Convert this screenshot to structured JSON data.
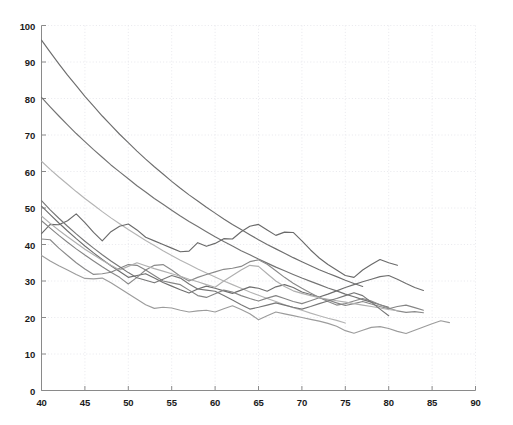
{
  "chart_data": {
    "type": "line",
    "title": "",
    "xlabel": "",
    "ylabel": "",
    "xlim": [
      40,
      90
    ],
    "ylim": [
      0,
      100
    ],
    "xticks": [
      40,
      45,
      50,
      55,
      60,
      65,
      70,
      75,
      80,
      85,
      90
    ],
    "yticks": [
      0,
      10,
      20,
      30,
      40,
      50,
      60,
      70,
      80,
      90,
      100
    ],
    "grid": true,
    "grid_style": "dotted",
    "grid_color": "#e2e2e8",
    "legend": "none",
    "background": "#ffffff",
    "axis_color": "#8a8a8a",
    "series": [
      {
        "name": "decay-1",
        "color": "#6e6e6e",
        "style": "smooth",
        "x": [
          40,
          41,
          42,
          43,
          44,
          45,
          46,
          47,
          48,
          49,
          50,
          51,
          52,
          53,
          54,
          55,
          56,
          57,
          58,
          59,
          60,
          61,
          62,
          63,
          64,
          65,
          66,
          67,
          68,
          69,
          70,
          71,
          72,
          73,
          74,
          75,
          76,
          77
        ],
        "y": [
          96.0,
          92.7,
          89.5,
          86.4,
          83.5,
          80.6,
          77.9,
          75.2,
          72.7,
          70.2,
          67.9,
          65.6,
          63.4,
          61.3,
          59.3,
          57.3,
          55.4,
          53.6,
          51.9,
          50.2,
          48.6,
          47.0,
          45.5,
          44.1,
          42.7,
          41.3,
          40.0,
          38.8,
          37.6,
          36.4,
          35.3,
          34.2,
          33.1,
          32.1,
          31.2,
          30.2,
          29.3,
          28.5
        ]
      },
      {
        "name": "decay-2",
        "color": "#737373",
        "style": "smooth",
        "x": [
          40,
          41,
          42,
          43,
          44,
          45,
          46,
          47,
          48,
          49,
          50,
          51,
          52,
          53,
          54,
          55,
          56,
          57,
          58,
          59,
          60,
          61,
          62,
          63,
          64,
          65,
          66,
          67,
          68,
          69,
          70,
          71,
          72,
          73,
          74,
          75,
          76,
          77,
          78,
          79,
          80
        ],
        "y": [
          80.3,
          77.7,
          75.2,
          72.8,
          70.4,
          68.2,
          66.0,
          63.9,
          61.8,
          59.9,
          58.0,
          56.1,
          54.4,
          52.6,
          51.0,
          49.4,
          47.8,
          46.3,
          44.9,
          43.5,
          42.1,
          40.8,
          39.6,
          38.3,
          37.2,
          36.0,
          34.9,
          33.8,
          32.8,
          31.8,
          30.8,
          29.9,
          29.0,
          28.1,
          27.3,
          26.4,
          25.7,
          24.9,
          24.2,
          23.5,
          22.8
        ]
      },
      {
        "name": "decay-3",
        "color": "#b4b4b4",
        "style": "smooth",
        "x": [
          40,
          41,
          42,
          43,
          44,
          45,
          46,
          47,
          48,
          49,
          50,
          51,
          52,
          53,
          54,
          55,
          56,
          57,
          58,
          59,
          60,
          61,
          62,
          63,
          64,
          65,
          66,
          67,
          68,
          69,
          70,
          71,
          72,
          73,
          74,
          75
        ],
        "y": [
          62.8,
          60.6,
          58.5,
          56.5,
          54.5,
          52.6,
          50.8,
          49.0,
          47.3,
          45.7,
          44.1,
          42.6,
          41.1,
          39.7,
          38.3,
          37.0,
          35.7,
          34.5,
          33.3,
          32.2,
          31.1,
          30.0,
          29.0,
          28.0,
          27.0,
          26.1,
          25.2,
          24.4,
          23.5,
          22.7,
          22.0,
          21.2,
          20.5,
          19.8,
          19.2,
          18.5
        ]
      },
      {
        "name": "noisy-1",
        "color": "#6a6a6a",
        "style": "zigzag",
        "x": [
          40,
          41,
          42,
          43,
          44,
          45,
          46,
          47,
          48,
          49,
          50,
          51,
          52,
          53,
          54,
          55,
          56,
          57,
          58,
          59,
          60,
          61,
          62,
          63,
          64,
          65,
          66,
          67,
          68,
          69,
          70,
          71,
          72,
          73,
          74,
          75,
          76,
          77,
          78,
          79,
          80,
          81
        ],
        "y": [
          43.0,
          45.5,
          45.4,
          46.5,
          48.4,
          46.0,
          43.3,
          41.0,
          43.5,
          45.0,
          45.6,
          44.0,
          42.0,
          41.0,
          40.0,
          39.0,
          38.0,
          38.2,
          40.5,
          39.5,
          40.3,
          41.6,
          41.5,
          43.5,
          45.0,
          45.5,
          44.0,
          42.5,
          43.4,
          43.3,
          41.0,
          38.5,
          36.3,
          34.5,
          33.0,
          31.5,
          31.0,
          33.0,
          34.5,
          35.9,
          35.0,
          34.3
        ]
      },
      {
        "name": "noisy-2",
        "color": "#6f6f6f",
        "style": "zigzag",
        "x": [
          40,
          41,
          42,
          43,
          44,
          45,
          46,
          47,
          48,
          49,
          50,
          51,
          52,
          53,
          54,
          55,
          56,
          57,
          58,
          59,
          60,
          61,
          62,
          63,
          64,
          65,
          66,
          67,
          68,
          69,
          70,
          71,
          72,
          73,
          74,
          75,
          76,
          77,
          78,
          79,
          80,
          81,
          82,
          83,
          84
        ],
        "y": [
          50.5,
          48.2,
          45.9,
          43.7,
          41.6,
          39.6,
          37.7,
          35.9,
          34.2,
          32.6,
          31.0,
          31.5,
          32.0,
          30.8,
          29.6,
          28.6,
          27.6,
          26.7,
          27.8,
          28.6,
          28.0,
          27.3,
          26.6,
          27.5,
          28.4,
          28.0,
          27.2,
          28.4,
          29.0,
          28.2,
          27.0,
          26.3,
          25.6,
          26.4,
          27.3,
          28.2,
          29.0,
          29.8,
          30.5,
          31.2,
          31.5,
          30.5,
          29.3,
          28.2,
          27.4
        ]
      },
      {
        "name": "noisy-3",
        "color": "#8a8a8a",
        "style": "zigzag",
        "x": [
          40,
          41,
          42,
          43,
          44,
          45,
          46,
          47,
          48,
          49,
          50,
          51,
          52,
          53,
          54,
          55,
          56,
          57,
          58,
          59,
          60,
          61,
          62,
          63,
          64,
          65,
          66,
          67,
          68,
          69,
          70,
          71,
          72,
          73,
          74,
          75,
          76,
          77,
          78,
          79,
          80,
          81,
          82,
          83,
          84
        ],
        "y": [
          41.5,
          41.3,
          39.0,
          37.0,
          35.0,
          33.3,
          31.8,
          32.0,
          32.4,
          31.0,
          29.2,
          31.0,
          33.0,
          34.3,
          34.5,
          33.0,
          31.3,
          30.0,
          31.0,
          31.8,
          32.5,
          33.2,
          33.5,
          34.0,
          35.3,
          35.8,
          34.6,
          32.8,
          31.0,
          29.4,
          28.0,
          26.7,
          25.5,
          24.4,
          23.4,
          23.8,
          24.5,
          25.2,
          24.5,
          23.5,
          22.6,
          21.8,
          21.4,
          21.6,
          21.3
        ]
      },
      {
        "name": "noisy-4",
        "color": "#9c9c9c",
        "style": "zigzag",
        "x": [
          40,
          41,
          42,
          43,
          44,
          45,
          46,
          47,
          48,
          49,
          50,
          51,
          52,
          53,
          54,
          55,
          56,
          57,
          58,
          59,
          60,
          61,
          62,
          63,
          64,
          65,
          66,
          67,
          68,
          69,
          70,
          71,
          72,
          73,
          74,
          75,
          76,
          77,
          78,
          79,
          80,
          81,
          82,
          83,
          84,
          85,
          86,
          87
        ],
        "y": [
          37.0,
          35.5,
          34.2,
          33.0,
          31.8,
          30.7,
          30.6,
          30.8,
          29.5,
          28.0,
          26.5,
          25.0,
          23.5,
          22.5,
          22.8,
          22.6,
          22.0,
          21.5,
          21.8,
          22.0,
          21.5,
          22.4,
          23.2,
          22.2,
          21.0,
          19.4,
          20.5,
          21.5,
          21.0,
          20.5,
          20.0,
          19.5,
          19.0,
          18.4,
          17.6,
          16.4,
          15.7,
          16.5,
          17.3,
          17.5,
          17.0,
          16.2,
          15.6,
          16.5,
          17.4,
          18.3,
          19.1,
          18.6
        ]
      },
      {
        "name": "noisy-5",
        "color": "#858585",
        "style": "zigzag",
        "x": [
          40,
          41,
          42,
          43,
          44,
          45,
          46,
          47,
          48,
          49,
          50,
          51,
          52,
          53,
          54,
          55,
          56,
          57,
          58,
          59,
          60,
          61,
          62,
          63,
          64,
          65,
          66,
          67,
          68,
          69,
          70,
          71,
          72,
          73,
          74,
          75,
          76,
          77,
          78,
          79,
          80,
          81,
          82,
          83,
          84
        ],
        "y": [
          46.5,
          44.5,
          42.5,
          40.6,
          38.8,
          37.1,
          35.5,
          33.9,
          32.4,
          33.5,
          34.5,
          34.3,
          33.0,
          31.5,
          30.0,
          29.5,
          29.0,
          27.5,
          26.0,
          25.5,
          26.5,
          27.5,
          27.0,
          26.0,
          25.2,
          24.5,
          25.3,
          26.0,
          25.2,
          24.4,
          23.8,
          24.6,
          25.4,
          24.8,
          24.0,
          23.3,
          23.8,
          24.4,
          23.7,
          23.0,
          22.4,
          23.0,
          23.4,
          22.7,
          22.0
        ]
      },
      {
        "name": "noisy-6",
        "color": "#afafaf",
        "style": "zigzag",
        "x": [
          40,
          41,
          42,
          43,
          44,
          45,
          46,
          47,
          48,
          49,
          50,
          51,
          52,
          53,
          54,
          55,
          56,
          57,
          58,
          59,
          60,
          61,
          62,
          63,
          64,
          65,
          66,
          67,
          68,
          69,
          70,
          71,
          72,
          73,
          74,
          75,
          76,
          77,
          78,
          79,
          80,
          81
        ],
        "y": [
          47.8,
          45.8,
          43.9,
          42.1,
          40.4,
          38.7,
          37.2,
          35.7,
          34.3,
          33.0,
          34.0,
          35.0,
          34.2,
          33.4,
          32.7,
          32.0,
          31.3,
          30.5,
          29.8,
          29.0,
          28.3,
          30.0,
          31.5,
          33.0,
          34.3,
          34.0,
          32.0,
          30.0,
          28.5,
          27.3,
          26.6,
          26.0,
          25.4,
          25.0,
          24.6,
          24.2,
          23.8,
          23.4,
          23.0,
          22.6,
          22.2,
          21.9
        ]
      },
      {
        "name": "noisy-7",
        "color": "#777777",
        "style": "zigzag",
        "x": [
          40,
          41,
          42,
          43,
          44,
          45,
          46,
          47,
          48,
          49,
          50,
          51,
          52,
          53,
          54,
          55,
          56,
          57,
          58,
          59,
          60,
          61,
          62,
          63,
          64,
          65,
          66,
          67,
          68,
          69,
          70,
          71,
          72,
          73,
          74,
          75,
          76,
          77,
          78,
          79,
          80
        ],
        "y": [
          52.0,
          49.5,
          47.2,
          45.0,
          42.9,
          40.9,
          39.0,
          37.2,
          35.5,
          33.9,
          32.3,
          30.9,
          30.2,
          29.5,
          30.5,
          31.5,
          30.8,
          29.2,
          27.8,
          27.5,
          27.2,
          26.0,
          24.8,
          23.5,
          22.3,
          22.8,
          23.4,
          24.0,
          23.4,
          22.8,
          22.3,
          23.0,
          23.8,
          24.5,
          25.2,
          26.0,
          26.8,
          26.0,
          24.2,
          22.3,
          20.5
        ]
      }
    ]
  }
}
